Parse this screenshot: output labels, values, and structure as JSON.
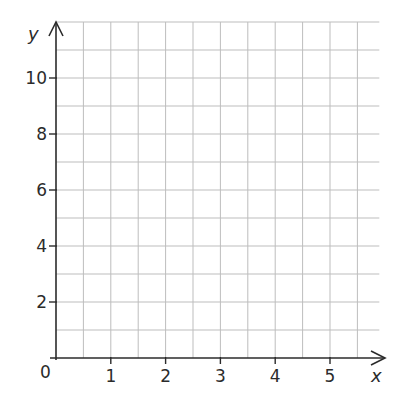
{
  "chart_data": {
    "type": "scatter",
    "title": "",
    "xlabel": "x",
    "ylabel": "y",
    "x_ticks": [
      "1",
      "2",
      "3",
      "4",
      "5"
    ],
    "y_ticks": [
      "2",
      "4",
      "6",
      "8",
      "10"
    ],
    "origin_label": "0",
    "xlim": [
      0,
      5.9
    ],
    "ylim": [
      0,
      12
    ],
    "grid": true,
    "grid_x_step": 0.5,
    "grid_y_step": 1,
    "series": [],
    "colors": {
      "grid": "#bdbdbd",
      "axis": "#2b2b2b"
    }
  }
}
